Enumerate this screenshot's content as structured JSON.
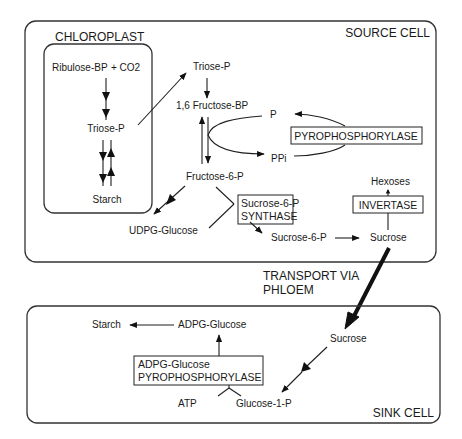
{
  "source_cell": {
    "title": "SOURCE CELL",
    "chloroplast": {
      "title": "CHLOROPLAST",
      "ribulose": "Ribulose-BP",
      "co2": "+ CO2",
      "triose": "Triose-P",
      "starch": "Starch"
    },
    "cytosol": {
      "triose": "Triose-P",
      "fructose_bp": "1,6 Fructose-BP",
      "p": "P",
      "ppi": "PPi",
      "pyrophosphorylase": "PYROPHOSPHORYLASE",
      "fructose_6p": "Fructose-6-P",
      "sps_line1": "Sucrose-6-P",
      "sps_line2": "SYNTHASE",
      "udpg": "UDPG-Glucose",
      "sucrose_6p": "Sucrose-6-P",
      "sucrose": "Sucrose",
      "invertase": "INVERTASE",
      "hexoses": "Hexoses"
    }
  },
  "transport": {
    "line1": "TRANSPORT VIA",
    "line2": "PHLOEM"
  },
  "sink_cell": {
    "title": "SINK CELL",
    "starch": "Starch",
    "adpg": "ADPG-Glucose",
    "enzyme_line1": "ADPG-Glucose",
    "enzyme_line2": "PYROPHOSPHORYLASE",
    "atp": "ATP",
    "glucose_1p": "Glucose-1-P",
    "sucrose": "Sucrose"
  },
  "colors": {
    "ink": "#1a1a1a",
    "background": "#ffffff"
  }
}
